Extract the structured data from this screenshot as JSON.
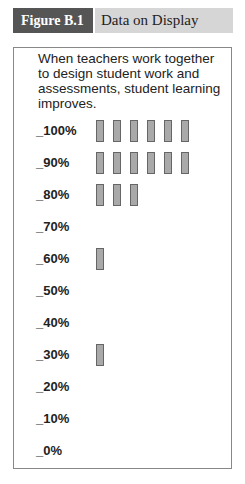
{
  "header": {
    "figure_label": "Figure B.1",
    "title": "Data on Display"
  },
  "caption": "When teachers work together to design student work and assessments, student learning improves.",
  "colors": {
    "label_bg": "#555555",
    "title_bg": "#d6d6d6",
    "bar_fill": "#a9a9a9",
    "bar_border": "#666666"
  },
  "chart_data": {
    "type": "bar",
    "title": "When teachers work together to design student work and assessments, student learning improves.",
    "orientation": "dot-plot / tally (horizontal rows of marks)",
    "categories": [
      "_100%",
      "_90%",
      "_80%",
      "_70%",
      "_60%",
      "_50%",
      "_40%",
      "_30%",
      "_20%",
      "_10%",
      "_0%"
    ],
    "values": [
      6,
      6,
      3,
      0,
      1,
      0,
      0,
      1,
      0,
      0,
      0
    ],
    "xlabel": "",
    "ylabel": "",
    "legend": "none",
    "grid": false
  },
  "rows": [
    {
      "label": "_100%",
      "count": 6
    },
    {
      "label": "_90%",
      "count": 6
    },
    {
      "label": "_80%",
      "count": 3
    },
    {
      "label": "_70%",
      "count": 0
    },
    {
      "label": "_60%",
      "count": 1
    },
    {
      "label": "_50%",
      "count": 0
    },
    {
      "label": "_40%",
      "count": 0
    },
    {
      "label": "_30%",
      "count": 1
    },
    {
      "label": "_20%",
      "count": 0
    },
    {
      "label": "_10%",
      "count": 0
    },
    {
      "label": "_0%",
      "count": 0
    }
  ]
}
